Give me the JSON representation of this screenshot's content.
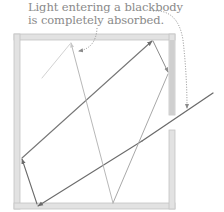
{
  "caption": {
    "line1": "Light entering a blackbody",
    "line2": "is completely absorbed."
  },
  "colors": {
    "wall_fill": "#e2e2e2",
    "wall_edge": "#c4c4c4",
    "ray_dark": "#6b6b6b",
    "ray_mid": "#8c8c8c",
    "ray_light": "#c8c8c8",
    "caption_text": "#8a8a8a",
    "annotation_dots": "#8a8a8a"
  },
  "diagram": {
    "type": "blackbody-cavity",
    "cavity": {
      "outer": [
        14,
        34,
        175,
        209
      ],
      "wall_thickness": 6,
      "opening_y": [
        115,
        130
      ]
    },
    "rays": [
      {
        "name": "incoming-ray",
        "from": [
          213,
          93
        ],
        "to": [
          142,
          141
        ],
        "shade": "dark"
      },
      {
        "name": "ray-1",
        "from": [
          142,
          141
        ],
        "to": [
          38,
          207
        ],
        "shade": "dark"
      },
      {
        "name": "ray-2",
        "from": [
          38,
          207
        ],
        "to": [
          22,
          158
        ],
        "shade": "dark"
      },
      {
        "name": "ray-3",
        "from": [
          22,
          158
        ],
        "to": [
          153,
          40
        ],
        "shade": "dark"
      },
      {
        "name": "ray-4",
        "from": [
          153,
          40
        ],
        "to": [
          168,
          73
        ],
        "shade": "mid"
      },
      {
        "name": "ray-5",
        "from": [
          168,
          73
        ],
        "to": [
          113,
          205
        ],
        "shade": "light"
      },
      {
        "name": "ray-6",
        "from": [
          113,
          205
        ],
        "to": [
          71,
          43
        ],
        "shade": "light"
      },
      {
        "name": "ray-7",
        "from": [
          71,
          43
        ],
        "to": [
          42,
          78
        ],
        "shade": "light"
      }
    ]
  }
}
